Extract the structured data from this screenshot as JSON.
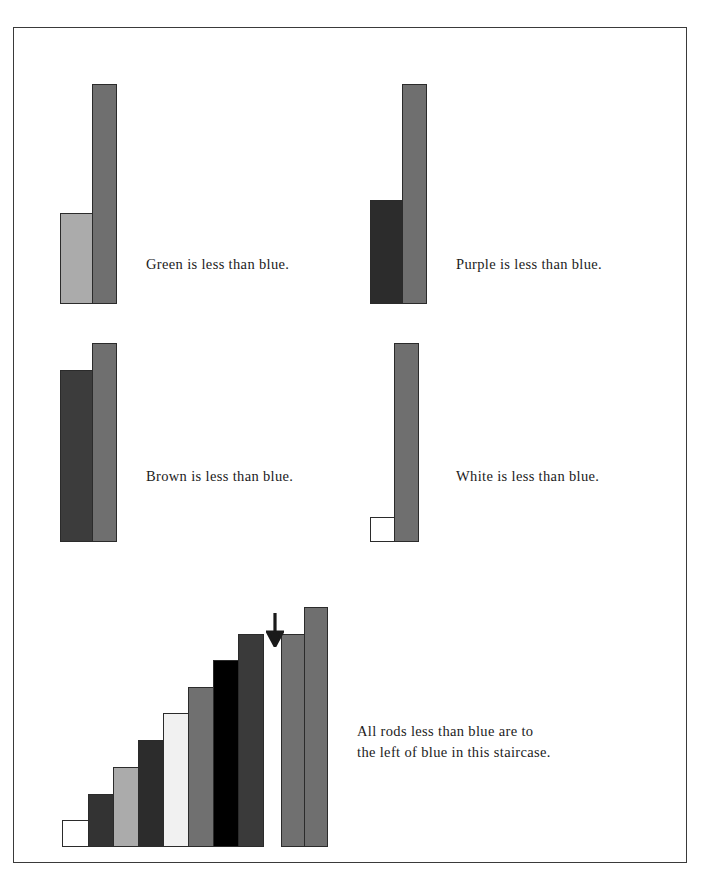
{
  "page": {
    "title": "Rods less than blue",
    "background": "#ffffff",
    "frame_color": "#3a3a3a",
    "outline_color": "#2b2b2b"
  },
  "palette": {
    "white": "#ffffff",
    "light_gray": "#ababab",
    "green": "#a9a9a9",
    "purple": "#2c2c2c",
    "brown": "#3c3c3c",
    "blue": "#707070",
    "black": "#000000",
    "dark": "#333333",
    "text": "#1c1c1c"
  },
  "comparisons": [
    {
      "id": "green-vs-blue",
      "caption": "Green is less than blue.",
      "short_rod": {
        "name": "green",
        "color": "#ababab",
        "height": 90,
        "width": 34
      },
      "tall_rod": {
        "name": "blue",
        "color": "#6f6f6f",
        "height": 209,
        "width": 25
      }
    },
    {
      "id": "purple-vs-blue",
      "caption": "Purple is less than blue.",
      "short_rod": {
        "name": "purple",
        "color": "#2c2c2c",
        "height": 92,
        "width": 34
      },
      "tall_rod": {
        "name": "blue",
        "color": "#6f6f6f",
        "height": 209,
        "width": 25
      }
    },
    {
      "id": "brown-vs-blue",
      "caption": "Brown is less than blue.",
      "short_rod": {
        "name": "brown",
        "color": "#3c3c3c",
        "height": 186,
        "width": 34
      },
      "tall_rod": {
        "name": "blue",
        "color": "#6f6f6f",
        "height": 209,
        "width": 25
      }
    },
    {
      "id": "white-vs-blue",
      "caption": "White is less than blue.",
      "short_rod": {
        "name": "white",
        "color": "#ffffff",
        "height": 24,
        "width": 26
      },
      "tall_rod": {
        "name": "blue",
        "color": "#6f6f6f",
        "height": 209,
        "width": 25
      }
    }
  ],
  "staircase": {
    "caption_line1": "All rods less than blue are to",
    "caption_line2": "the left of blue in this staircase.",
    "arrow": {
      "name": "down-arrow",
      "points_to": "blue"
    },
    "rods": [
      {
        "name": "white",
        "color": "#ffffff",
        "height": 27,
        "width": 26
      },
      {
        "name": "red",
        "color": "#333333",
        "height": 53,
        "width": 25
      },
      {
        "name": "green",
        "color": "#ababab",
        "height": 80,
        "width": 25
      },
      {
        "name": "purple",
        "color": "#2c2c2c",
        "height": 107,
        "width": 25
      },
      {
        "name": "yellow",
        "color": "#f1f1f1",
        "height": 134,
        "width": 25
      },
      {
        "name": "dark-green",
        "color": "#707070",
        "height": 160,
        "width": 25
      },
      {
        "name": "black",
        "color": "#000000",
        "height": 187,
        "width": 25
      },
      {
        "name": "brown",
        "color": "#3a3a3a",
        "height": 213,
        "width": 25
      }
    ],
    "pair": [
      {
        "name": "blue",
        "color": "#707070",
        "height": 213,
        "width": 23
      },
      {
        "name": "orange",
        "color": "#6f6f6f",
        "height": 240,
        "width": 23
      }
    ]
  }
}
